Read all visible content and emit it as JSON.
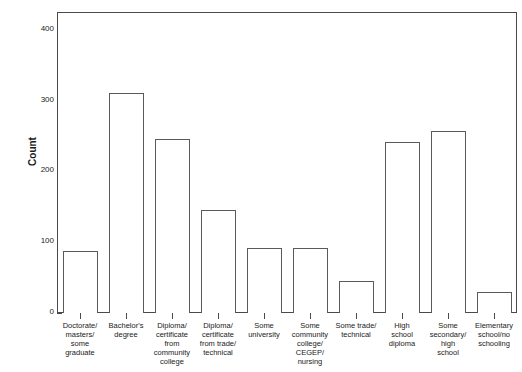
{
  "chart_data": {
    "type": "bar",
    "title": "",
    "xlabel": "",
    "ylabel": "Count",
    "ylim": [
      0,
      425
    ],
    "yticks": [
      0,
      100,
      200,
      300,
      400
    ],
    "ytick_labels": [
      "0",
      "100",
      "200",
      "300",
      "400"
    ],
    "grid": false,
    "legend": false,
    "bar_style": "open outlined bars, white fill, dark gray border",
    "categories": [
      "Doctorate/ masters/ some graduate",
      "Bachelor's degree",
      "Diploma/ certificate from community college",
      "Diploma/ certificate from trade/ technical",
      "Some university",
      "Some community college/ CEGEP/ nursing",
      "Some trade/ technical",
      "High school diploma",
      "Some secondary/ high school",
      "Elementary school/no schooling"
    ],
    "category_lines": [
      [
        "Doctorate/",
        "masters/",
        "some",
        "graduate"
      ],
      [
        "Bachelor's",
        "degree"
      ],
      [
        "Diploma/",
        "certificate",
        "from",
        "community",
        "college"
      ],
      [
        "Diploma/",
        "certificate",
        "from trade/",
        "technical"
      ],
      [
        "Some",
        "university"
      ],
      [
        "Some",
        "community",
        "college/",
        "CEGEP/",
        "nursing"
      ],
      [
        "Some trade/",
        "technical"
      ],
      [
        "High",
        "school",
        "diploma"
      ],
      [
        "Some",
        "secondary/",
        "high",
        "school"
      ],
      [
        "Elementary",
        "school/no",
        "schooling"
      ]
    ],
    "values": [
      88,
      310,
      245,
      145,
      92,
      92,
      45,
      242,
      257,
      30
    ]
  },
  "colors": {
    "background": "#ffffff",
    "axis": "#4a4a4a",
    "bar_border": "#5a5a5a",
    "bar_fill": "#ffffff",
    "text": "#1a1a1a"
  }
}
